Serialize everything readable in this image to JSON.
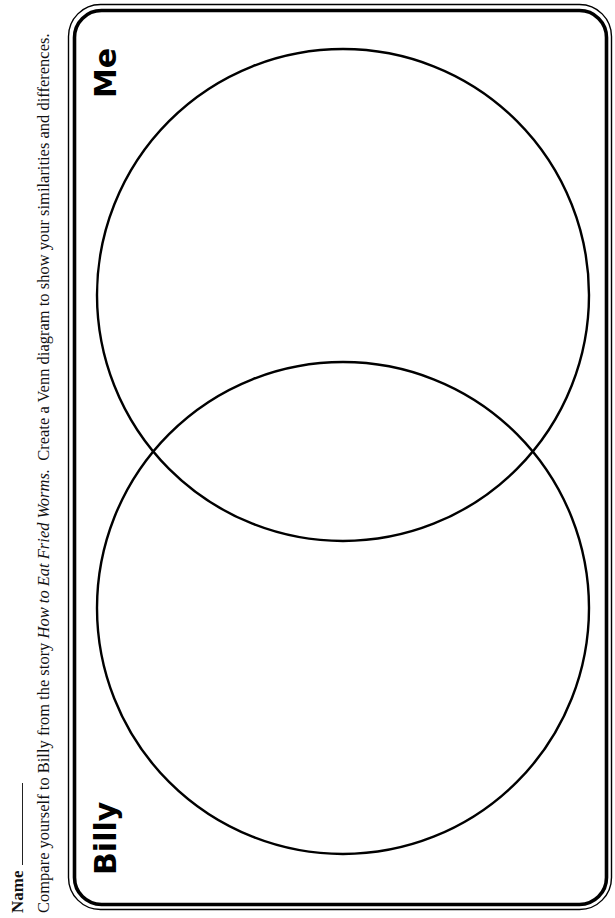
{
  "worksheet": {
    "name_label": "Name",
    "instructions": {
      "before_title": "Compare yourself to Billy from the story ",
      "book_title": "How to Eat Fried Worms.",
      "after_title": "  Create a Venn diagram to show your similarities and differences."
    }
  },
  "venn_diagram": {
    "left_label": "Billy",
    "right_label": "Me",
    "circles": [
      {
        "name": "Billy",
        "cx": 343,
        "cy": 608,
        "r": 246
      },
      {
        "name": "Me",
        "cx": 343,
        "cy": 295,
        "r": 246
      }
    ],
    "frame_color": "#000000",
    "line_color": "#000000"
  }
}
